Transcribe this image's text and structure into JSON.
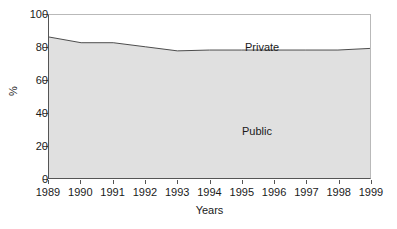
{
  "chart_data": {
    "type": "area",
    "title": "",
    "subtitle": "",
    "xlabel": "Years",
    "ylabel": "%",
    "xlim": [
      1989,
      1999
    ],
    "ylim": [
      0,
      100
    ],
    "grid": false,
    "legend_position": "inline-annotations",
    "stacked": true,
    "x": [
      1989,
      1990,
      1991,
      1992,
      1993,
      1994,
      1995,
      1996,
      1997,
      1998,
      1999
    ],
    "x_tick_labels": [
      "1989",
      "1990",
      "1991",
      "1992",
      "1993",
      "1994",
      "1995",
      "1996",
      "1997",
      "1998",
      "1999"
    ],
    "y_tick_labels": [
      "0",
      "20",
      "40",
      "60",
      "80",
      "100"
    ],
    "y_ticks": [
      0,
      20,
      40,
      60,
      80,
      100
    ],
    "series": [
      {
        "name": "Public",
        "color": "#e0e0e0",
        "line_color": "#4d4d4d",
        "values": [
          86.5,
          83.0,
          83.0,
          80.5,
          78.0,
          78.5,
          78.5,
          78.5,
          78.5,
          78.5,
          79.5
        ]
      },
      {
        "name": "Private",
        "color": "#ffffff",
        "line_color": "#4d4d4d",
        "values": [
          13.5,
          17.0,
          17.0,
          19.5,
          22.0,
          21.5,
          21.5,
          21.5,
          21.5,
          21.5,
          20.5
        ]
      }
    ],
    "annotations": [
      {
        "text": "Private",
        "x": 1994,
        "y": 91
      },
      {
        "text": "Public",
        "x": 1993.8,
        "y": 42
      }
    ]
  },
  "axes": {
    "y_title": "%",
    "x_title": "Years"
  },
  "labels": {
    "private": "Private",
    "public": "Public"
  },
  "colors": {
    "public_fill": "#e0e0e0",
    "private_fill": "#ffffff",
    "line": "#4d4d4d",
    "axis": "#555555",
    "frame": "#b9b9b9",
    "text": "#1a1a1a"
  }
}
